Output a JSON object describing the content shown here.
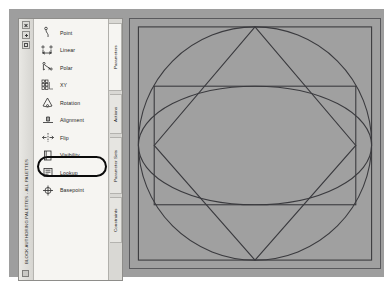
{
  "window": {
    "title": "BLOCK AUTHORING PALETTES - ALL PALETTES",
    "titlebar_buttons": [
      {
        "name": "close",
        "label": "x"
      },
      {
        "name": "autohide",
        "label": "+"
      },
      {
        "name": "properties-menu",
        "label": "="
      }
    ]
  },
  "palette": {
    "items": [
      {
        "label": "Point",
        "icon": "point-icon"
      },
      {
        "label": "Linear",
        "icon": "linear-icon"
      },
      {
        "label": "Polar",
        "icon": "polar-icon"
      },
      {
        "label": "XY",
        "icon": "xy-icon"
      },
      {
        "label": "Rotation",
        "icon": "rotation-icon"
      },
      {
        "label": "Alignment",
        "icon": "alignment-icon"
      },
      {
        "label": "Flip",
        "icon": "flip-icon"
      },
      {
        "label": "Visibility",
        "icon": "visibility-icon"
      },
      {
        "label": "Lookup",
        "icon": "lookup-icon"
      },
      {
        "label": "Basepoint",
        "icon": "basepoint-icon"
      }
    ],
    "highlighted_item": "Visibility",
    "tabs": [
      {
        "label": "Parameters",
        "active": true
      },
      {
        "label": "Actions",
        "active": false
      },
      {
        "label": "Parameter Sets",
        "active": false
      },
      {
        "label": "Constraints",
        "active": false
      }
    ]
  },
  "canvas": {
    "label": "drawing-area",
    "background_color": "#a0a0a0",
    "line_color": "#3a3a3e",
    "shapes": [
      {
        "name": "outer-square",
        "type": "rect",
        "x": 8,
        "y": 8,
        "w": 236,
        "h": 236
      },
      {
        "name": "circle",
        "type": "circle",
        "cx": 126,
        "cy": 126,
        "r": 118
      },
      {
        "name": "ellipse",
        "type": "ellipse",
        "cx": 126,
        "cy": 128,
        "rx": 118,
        "ry": 60
      },
      {
        "name": "inner-rectangle",
        "type": "rect",
        "x": 24,
        "y": 68,
        "w": 204,
        "h": 120
      },
      {
        "name": "diamond",
        "type": "polygon",
        "points": "126,8 228,128 126,244 24,128"
      }
    ]
  }
}
